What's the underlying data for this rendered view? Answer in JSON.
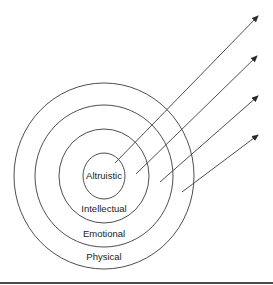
{
  "diagram": {
    "type": "concentric-circles-with-arrows",
    "center": {
      "x": 104,
      "y": 176
    },
    "rings": [
      {
        "name": "Altruistic",
        "rx": 21,
        "ry": 23
      },
      {
        "name": "Intellectual",
        "rx": 45,
        "ry": 47
      },
      {
        "name": "Emotional",
        "rx": 69,
        "ry": 71
      },
      {
        "name": "Physical",
        "rx": 90,
        "ry": 93
      }
    ],
    "labels": {
      "altruistic": "Altruistic",
      "intellectual": "Intellectual",
      "emotional": "Emotional",
      "physical": "Physical"
    },
    "arrows": [
      {
        "from": [
          115,
          163
        ],
        "to": [
          258,
          16
        ]
      },
      {
        "from": [
          136,
          174
        ],
        "to": [
          257,
          56
        ]
      },
      {
        "from": [
          160,
          182
        ],
        "to": [
          258,
          96
        ]
      },
      {
        "from": [
          182,
          192
        ],
        "to": [
          258,
          135
        ]
      }
    ],
    "colors": {
      "line": "#3a3a3a",
      "text": "#222222",
      "rule": "#4a4a4a",
      "background": "#ffffff"
    }
  }
}
